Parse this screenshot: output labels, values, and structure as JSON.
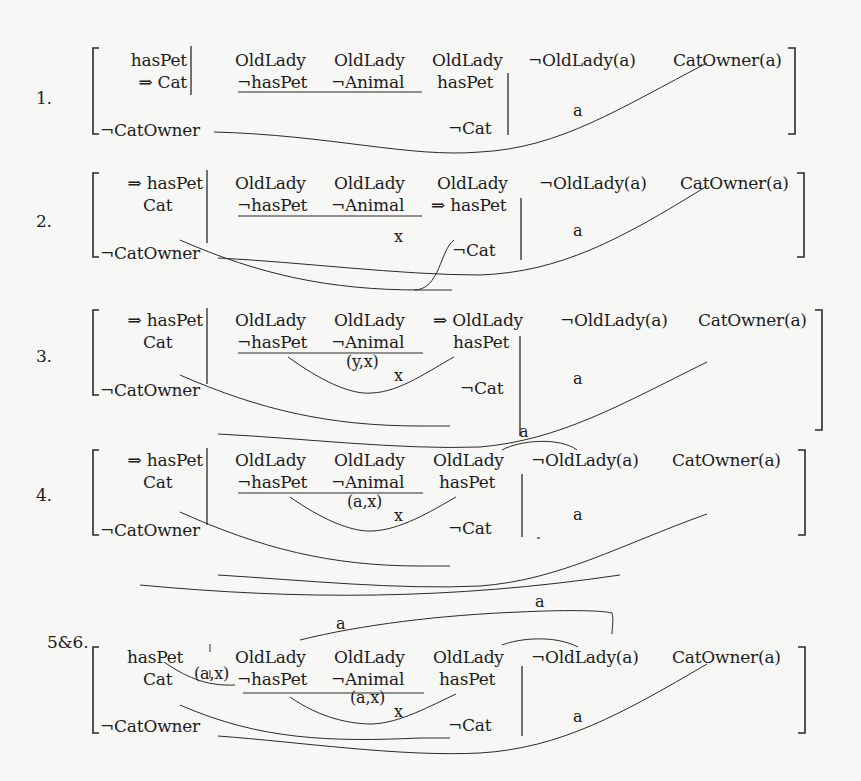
{
  "diagram": {
    "type": "connection-method-matrices",
    "steps": [
      {
        "label": "1.",
        "left_column": [
          "hasPet",
          "⇒ Cat",
          "¬CatOwner"
        ],
        "columns": [
          {
            "top": "OldLady",
            "bottom": "¬hasPet"
          },
          {
            "top": "OldLady",
            "bottom": "¬Animal"
          },
          {
            "top": "OldLady",
            "middle": "hasPet",
            "bottom": "¬Cat"
          }
        ],
        "right_terms": [
          "¬OldLady(a)",
          "CatOwner(a)"
        ],
        "arc_labels": [
          "a"
        ]
      },
      {
        "label": "2.",
        "left_column": [
          "⇒ hasPet",
          "Cat",
          "¬CatOwner"
        ],
        "columns": [
          {
            "top": "OldLady",
            "bottom": "¬hasPet"
          },
          {
            "top": "OldLady",
            "bottom": "¬Animal"
          },
          {
            "top": "OldLady",
            "middle": "⇒ hasPet",
            "bottom": "¬Cat"
          }
        ],
        "right_terms": [
          "¬OldLady(a)",
          "CatOwner(a)"
        ],
        "arc_labels": [
          "x",
          "a"
        ]
      },
      {
        "label": "3.",
        "left_column": [
          "⇒ hasPet",
          "Cat",
          "¬CatOwner"
        ],
        "columns": [
          {
            "top": "OldLady",
            "bottom": "¬hasPet"
          },
          {
            "top": "OldLady",
            "bottom": "¬Animal"
          },
          {
            "top": "⇒ OldLady",
            "middle": "hasPet",
            "bottom": "¬Cat"
          }
        ],
        "right_terms": [
          "¬OldLady(a)",
          "CatOwner(a)"
        ],
        "arc_labels": [
          "(y,x)",
          "x",
          "a"
        ]
      },
      {
        "label": "4.",
        "left_column": [
          "⇒ hasPet",
          "Cat",
          "¬CatOwner"
        ],
        "columns": [
          {
            "top": "OldLady",
            "bottom": "¬hasPet"
          },
          {
            "top": "OldLady",
            "bottom": "¬Animal"
          },
          {
            "top": "OldLady",
            "middle": "hasPet",
            "bottom": "¬Cat"
          }
        ],
        "right_terms": [
          "¬OldLady(a)",
          "CatOwner(a)"
        ],
        "arc_labels": [
          "a",
          "(a,x)",
          "x",
          "a"
        ]
      },
      {
        "label": "5&6.",
        "left_column": [
          "hasPet",
          "Cat",
          "¬CatOwner"
        ],
        "columns": [
          {
            "top": "OldLady",
            "bottom": "¬hasPet"
          },
          {
            "top": "OldLady",
            "bottom": "¬Animal"
          },
          {
            "top": "OldLady",
            "middle": "hasPet",
            "bottom": "¬Cat"
          }
        ],
        "right_terms": [
          "¬OldLady(a)",
          "CatOwner(a)"
        ],
        "arc_labels": [
          "a",
          "a",
          "(a,x)",
          "(a,x)",
          "x",
          "a"
        ]
      }
    ]
  }
}
